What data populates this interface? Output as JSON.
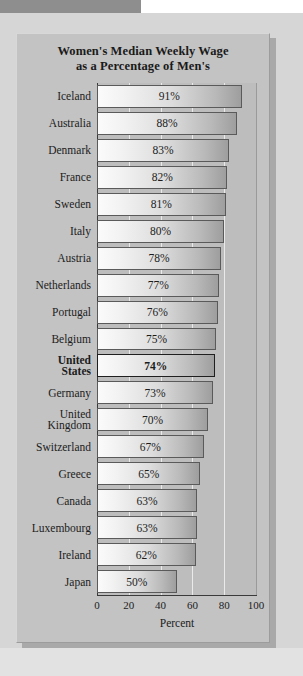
{
  "chart_data": {
    "type": "bar",
    "orientation": "horizontal",
    "title": "Women's Median Weekly Wage as a Percentage of Men's",
    "title_lines": [
      "Women's Median Weekly Wage",
      "as a Percentage of Men's"
    ],
    "xlabel": "Percent",
    "ylabel": "",
    "xlim": [
      0,
      100
    ],
    "xticks": [
      0,
      20,
      40,
      60,
      80,
      100
    ],
    "xtick_labels": [
      "0",
      "20",
      "40",
      "60",
      "80",
      "100"
    ],
    "grid": "vertical gridlines at 20, 40, 60, 80",
    "legend": "none",
    "highlight": "United States",
    "categories": [
      "Iceland",
      "Australia",
      "Denmark",
      "France",
      "Sweden",
      "Italy",
      "Austria",
      "Netherlands",
      "Portugal",
      "Belgium",
      "United States",
      "Germany",
      "United Kingdom",
      "Switzerland",
      "Greece",
      "Canada",
      "Luxembourg",
      "Ireland",
      "Japan"
    ],
    "values": [
      91,
      88,
      83,
      82,
      81,
      80,
      78,
      77,
      76,
      75,
      74,
      73,
      70,
      67,
      65,
      63,
      63,
      62,
      50
    ],
    "value_labels": [
      "91%",
      "88%",
      "83%",
      "82%",
      "81%",
      "80%",
      "78%",
      "77%",
      "76%",
      "75%",
      "74%",
      "73%",
      "70%",
      "67%",
      "65%",
      "63%",
      "63%",
      "62%",
      "50%"
    ],
    "rows": [
      {
        "label": "Iceland",
        "label_lines": [
          "Iceland"
        ],
        "value": 91,
        "value_label": "91%",
        "emphasis": false
      },
      {
        "label": "Australia",
        "label_lines": [
          "Australia"
        ],
        "value": 88,
        "value_label": "88%",
        "emphasis": false
      },
      {
        "label": "Denmark",
        "label_lines": [
          "Denmark"
        ],
        "value": 83,
        "value_label": "83%",
        "emphasis": false
      },
      {
        "label": "France",
        "label_lines": [
          "France"
        ],
        "value": 82,
        "value_label": "82%",
        "emphasis": false
      },
      {
        "label": "Sweden",
        "label_lines": [
          "Sweden"
        ],
        "value": 81,
        "value_label": "81%",
        "emphasis": false
      },
      {
        "label": "Italy",
        "label_lines": [
          "Italy"
        ],
        "value": 80,
        "value_label": "80%",
        "emphasis": false
      },
      {
        "label": "Austria",
        "label_lines": [
          "Austria"
        ],
        "value": 78,
        "value_label": "78%",
        "emphasis": false
      },
      {
        "label": "Netherlands",
        "label_lines": [
          "Netherlands"
        ],
        "value": 77,
        "value_label": "77%",
        "emphasis": false
      },
      {
        "label": "Portugal",
        "label_lines": [
          "Portugal"
        ],
        "value": 76,
        "value_label": "76%",
        "emphasis": false
      },
      {
        "label": "Belgium",
        "label_lines": [
          "Belgium"
        ],
        "value": 75,
        "value_label": "75%",
        "emphasis": false
      },
      {
        "label": "United States",
        "label_lines": [
          "United",
          "States"
        ],
        "value": 74,
        "value_label": "74%",
        "emphasis": true
      },
      {
        "label": "Germany",
        "label_lines": [
          "Germany"
        ],
        "value": 73,
        "value_label": "73%",
        "emphasis": false
      },
      {
        "label": "United Kingdom",
        "label_lines": [
          "United",
          "Kingdom"
        ],
        "value": 70,
        "value_label": "70%",
        "emphasis": false
      },
      {
        "label": "Switzerland",
        "label_lines": [
          "Switzerland"
        ],
        "value": 67,
        "value_label": "67%",
        "emphasis": false
      },
      {
        "label": "Greece",
        "label_lines": [
          "Greece"
        ],
        "value": 65,
        "value_label": "65%",
        "emphasis": false
      },
      {
        "label": "Canada",
        "label_lines": [
          "Canada"
        ],
        "value": 63,
        "value_label": "63%",
        "emphasis": false
      },
      {
        "label": "Luxembourg",
        "label_lines": [
          "Luxembourg"
        ],
        "value": 63,
        "value_label": "63%",
        "emphasis": false
      },
      {
        "label": "Ireland",
        "label_lines": [
          "Ireland"
        ],
        "value": 62,
        "value_label": "62%",
        "emphasis": false
      },
      {
        "label": "Japan",
        "label_lines": [
          "Japan"
        ],
        "value": 50,
        "value_label": "50%",
        "emphasis": false
      }
    ]
  },
  "colors": {
    "page_background": "#d6d6d6",
    "card_background": "#c3c3c3",
    "plot_background": "#bdbdbd",
    "bar_light": "#fbfbfb",
    "bar_dark": "#9e9e9e",
    "bar_border": "#5a5a5a",
    "bar_border_emphasis": "#1f1f1f",
    "gridline": "#eaeaea",
    "axis": "#3a3a3a",
    "text": "#1c1c1c"
  }
}
